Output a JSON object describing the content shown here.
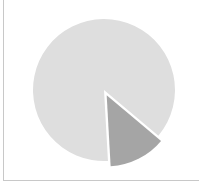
{
  "chart_data": {
    "type": "pie",
    "title": "",
    "labels": [
      "Slice A",
      "Slice B"
    ],
    "values": [
      87,
      13
    ],
    "colors": [
      "#dedede",
      "#a5a5a5"
    ],
    "exploded": [
      false,
      true
    ],
    "start_angle_deg": 130,
    "legend": "none"
  }
}
